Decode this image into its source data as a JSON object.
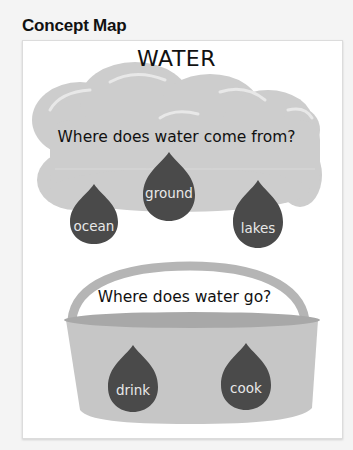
{
  "page": {
    "heading": "Concept Map"
  },
  "map": {
    "title": "WATER",
    "source": {
      "question": "Where does water come from?",
      "answers": [
        "ocean",
        "ground",
        "lakes"
      ]
    },
    "use": {
      "question": "Where does water go?",
      "answers": [
        "drink",
        "cook"
      ]
    }
  },
  "colors": {
    "cloud": "#cdcdcd",
    "cloud_highlight": "#e6e6e6",
    "drop": "#4a4a4a",
    "bucket": "#c6c6c6",
    "bucket_rim": "#a8a8a8",
    "handle": "#b5b5b5"
  }
}
